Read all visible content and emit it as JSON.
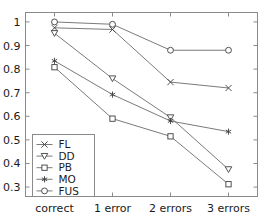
{
  "chart_data": {
    "type": "line",
    "title": "",
    "xlabel": "",
    "ylabel": "",
    "categories": [
      "correct",
      "1 error",
      "2 errors",
      "3 errors"
    ],
    "ylim": [
      0.26,
      1.04
    ],
    "yticks": [
      "0.3",
      "0.4",
      "0.5",
      "0.6",
      "0.7",
      "0.8",
      "0.9",
      "1"
    ],
    "ytick_values": [
      0.3,
      0.4,
      0.5,
      0.6,
      0.7,
      0.8,
      0.9,
      1.0
    ],
    "grid": false,
    "legend_position": "lower-left",
    "series": [
      {
        "name": "FL",
        "marker": "cross",
        "values": [
          0.975,
          0.968,
          0.745,
          0.72
        ]
      },
      {
        "name": "DD",
        "marker": "triangle-down",
        "values": [
          0.952,
          0.76,
          0.595,
          0.375
        ]
      },
      {
        "name": "PB",
        "marker": "square",
        "values": [
          0.808,
          0.59,
          0.515,
          0.312
        ]
      },
      {
        "name": "MO",
        "marker": "asterisk",
        "values": [
          0.835,
          0.692,
          0.58,
          0.535
        ]
      },
      {
        "name": "FUS",
        "marker": "circle",
        "values": [
          1.0,
          0.99,
          0.88,
          0.88
        ]
      }
    ]
  },
  "legend": {
    "entries": [
      {
        "label": "FL"
      },
      {
        "label": "DD"
      },
      {
        "label": "PB"
      },
      {
        "label": "MO"
      },
      {
        "label": "FUS"
      }
    ]
  },
  "colors": {
    "axis": "#8a8a8a",
    "line": "#6b6b6b",
    "marker": "#3d3d3d",
    "text": "#1a1a1a",
    "background": "#ffffff"
  }
}
